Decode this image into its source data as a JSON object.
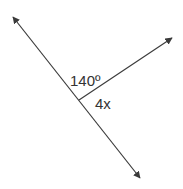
{
  "diagram": {
    "type": "geometry-angles",
    "colors": {
      "line": "#3a3a3a",
      "text": "#333333",
      "background": "#ffffff"
    },
    "line": {
      "from": [
        13,
        17
      ],
      "to": [
        140,
        178
      ],
      "arrows": "both"
    },
    "ray": {
      "from": [
        79,
        100
      ],
      "to": [
        172,
        38
      ],
      "arrows": "end"
    },
    "labels": {
      "upper_angle": "140º",
      "lower_angle": "4x"
    }
  }
}
